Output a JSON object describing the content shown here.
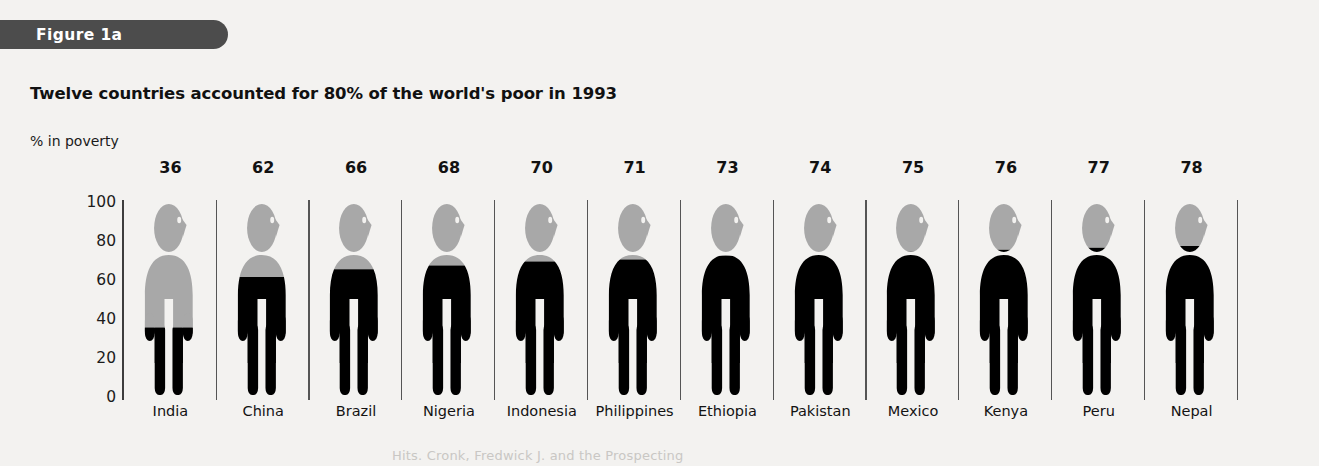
{
  "figure": {
    "tab_label": "Figure 1a"
  },
  "chart_data": {
    "type": "bar",
    "title": "Twelve countries accounted for 80% of the world's poor in 1993",
    "xlabel": "",
    "ylabel": "% in poverty",
    "ylim": [
      0,
      100
    ],
    "yticks": [
      "100",
      "80",
      "60",
      "40",
      "20",
      "0"
    ],
    "grid": false,
    "legend": "none",
    "categories": [
      "India",
      "China",
      "Brazil",
      "Nigeria",
      "Indonesia",
      "Philippines",
      "Ethiopia",
      "Pakistan",
      "Mexico",
      "Kenya",
      "Peru",
      "Nepal"
    ],
    "values": [
      36,
      62,
      66,
      68,
      70,
      71,
      73,
      74,
      75,
      76,
      77,
      78
    ],
    "value_labels": [
      "36",
      "62",
      "66",
      "68",
      "70",
      "71",
      "73",
      "74",
      "75",
      "76",
      "77",
      "78"
    ],
    "marker": "human-pictogram-filled-from-bottom",
    "colors": {
      "fill": "#000000",
      "empty": "#a8a8a8",
      "axis": "#3d3d3d",
      "background": "#f3f2f0",
      "tab": "#4c4c4c"
    }
  },
  "footer": {
    "bleed_text": "Hits. Cronk, Fredwick J. and the Prospecting"
  }
}
